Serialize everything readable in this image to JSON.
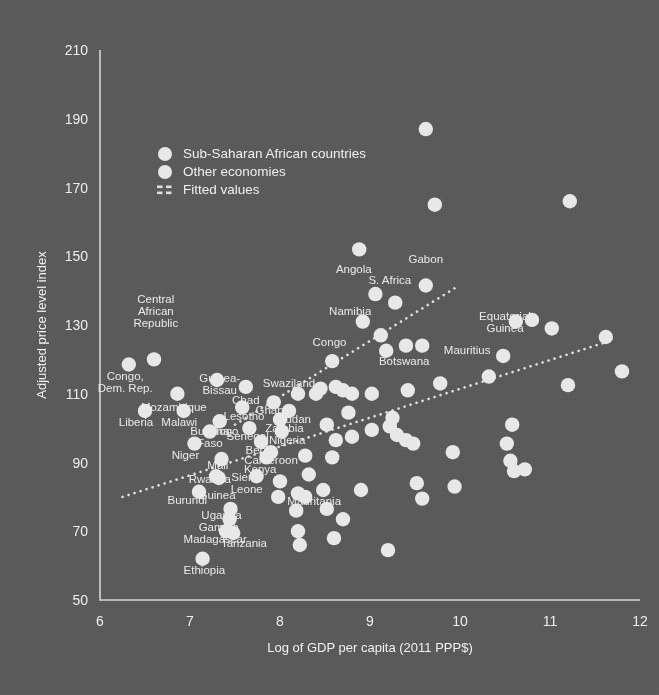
{
  "chart_data": {
    "type": "scatter",
    "title": "",
    "xlabel": "Log of GDP per capita (2011 PPP$)",
    "ylabel": "Adjusted price level index",
    "xlim": [
      6,
      12
    ],
    "ylim": [
      50,
      210
    ],
    "xticks": [
      "6",
      "7",
      "8",
      "9",
      "10",
      "11",
      "12"
    ],
    "yticks": [
      "50",
      "70",
      "90",
      "110",
      "130",
      "150",
      "170",
      "190",
      "210"
    ],
    "grid": false,
    "legend_position": "upper-left-inside",
    "legend": [
      {
        "label": "Sub-Saharan African countries",
        "marker": "circle",
        "color": "#e8e8e8"
      },
      {
        "label": "Other economies",
        "marker": "circle",
        "color": "#e8e8e8"
      },
      {
        "label": "Fitted values",
        "marker": "dotted-line",
        "color": "#e0e0e0"
      }
    ],
    "series": [
      {
        "name": "Sub-Saharan African countries",
        "color": "#e8e8e8",
        "points": [
          {
            "label": "Congo, Dem. Rep.",
            "x": 6.32,
            "y": 118.5,
            "lx": 6.28,
            "ly": 110.5,
            "anchor": "middle"
          },
          {
            "label": "Central African Republic",
            "x": 6.6,
            "y": 120.0,
            "lx": 6.62,
            "ly": 129.5,
            "anchor": "middle"
          },
          {
            "label": "Liberia",
            "x": 6.5,
            "y": 105.0,
            "lx": 6.4,
            "ly": 100.5,
            "anchor": "middle"
          },
          {
            "label": "Mozambique",
            "x": 6.86,
            "y": 110.0,
            "lx": 6.82,
            "ly": 105.0,
            "anchor": "middle"
          },
          {
            "label": "Malawi",
            "x": 6.93,
            "y": 105.0,
            "lx": 6.88,
            "ly": 100.5,
            "anchor": "middle"
          },
          {
            "label": "Niger",
            "x": 7.05,
            "y": 95.5,
            "lx": 6.95,
            "ly": 91.0,
            "anchor": "middle"
          },
          {
            "label": "Burkina Faso",
            "x": 7.22,
            "y": 99.0,
            "lx": 7.22,
            "ly": 94.5,
            "anchor": "middle"
          },
          {
            "label": "Burundi",
            "x": 7.1,
            "y": 81.5,
            "lx": 6.97,
            "ly": 78.0,
            "anchor": "middle"
          },
          {
            "label": "Rwanda",
            "x": 7.29,
            "y": 86.0,
            "lx": 7.22,
            "ly": 84.0,
            "anchor": "middle"
          },
          {
            "label": "Guinea",
            "x": 7.32,
            "y": 85.5,
            "lx": 7.3,
            "ly": 79.5,
            "anchor": "middle"
          },
          {
            "label": "Mali",
            "x": 7.35,
            "y": 91.0,
            "lx": 7.31,
            "ly": 88.0,
            "anchor": "middle"
          },
          {
            "label": "Guinea-Bissau",
            "x": 7.3,
            "y": 114.0,
            "lx": 7.33,
            "ly": 110.0,
            "anchor": "middle"
          },
          {
            "label": "Togo",
            "x": 7.33,
            "y": 102.0,
            "lx": 7.4,
            "ly": 98.0,
            "anchor": "middle"
          },
          {
            "label": "Lesotho",
            "x": 7.58,
            "y": 106.0,
            "lx": 7.6,
            "ly": 102.5,
            "anchor": "middle"
          },
          {
            "label": "Chad",
            "x": 7.62,
            "y": 112.0,
            "lx": 7.62,
            "ly": 107.0,
            "anchor": "middle"
          },
          {
            "label": "Senegal",
            "x": 7.66,
            "y": 100.0,
            "lx": 7.64,
            "ly": 96.5,
            "anchor": "middle"
          },
          {
            "label": "Uganda",
            "x": 7.45,
            "y": 76.5,
            "lx": 7.35,
            "ly": 73.5,
            "anchor": "middle"
          },
          {
            "label": "Gambia",
            "x": 7.44,
            "y": 73.5,
            "lx": 7.32,
            "ly": 70.0,
            "anchor": "middle"
          },
          {
            "label": "Madagascar",
            "x": 7.4,
            "y": 70.0,
            "lx": 7.28,
            "ly": 66.5,
            "anchor": "middle"
          },
          {
            "label": "Tanzania",
            "x": 7.48,
            "y": 69.5,
            "lx": 7.6,
            "ly": 65.5,
            "anchor": "middle"
          },
          {
            "label": "Ethiopia",
            "x": 7.14,
            "y": 62.0,
            "lx": 7.16,
            "ly": 57.5,
            "anchor": "middle"
          },
          {
            "label": "Sierra Leone",
            "x": 7.74,
            "y": 86.0,
            "lx": 7.63,
            "ly": 81.0,
            "anchor": "middle"
          },
          {
            "label": "Kenya",
            "x": 7.85,
            "y": 91.5,
            "lx": 7.78,
            "ly": 87.0,
            "anchor": "middle"
          },
          {
            "label": "Benin",
            "x": 7.79,
            "y": 96.0,
            "lx": 7.78,
            "ly": 92.5,
            "anchor": "middle"
          },
          {
            "label": "Cameroon",
            "x": 7.9,
            "y": 93.0,
            "lx": 7.9,
            "ly": 89.5,
            "anchor": "middle"
          },
          {
            "label": "Zambia",
            "x": 8.0,
            "y": 102.5,
            "lx": 8.05,
            "ly": 99.0,
            "anchor": "middle"
          },
          {
            "label": "Nigeria",
            "x": 8.02,
            "y": 99.0,
            "lx": 8.08,
            "ly": 95.5,
            "anchor": "middle"
          },
          {
            "label": "Ghana",
            "x": 7.93,
            "y": 107.5,
            "lx": 7.92,
            "ly": 104.0,
            "anchor": "middle"
          },
          {
            "label": "Sudan",
            "x": 8.1,
            "y": 105.0,
            "lx": 8.16,
            "ly": 101.5,
            "anchor": "middle"
          },
          {
            "label": "Swaziland",
            "x": 8.2,
            "y": 110.0,
            "lx": 8.1,
            "ly": 112.0,
            "anchor": "middle"
          },
          {
            "label": "Mauritania",
            "x": 8.28,
            "y": 80.0,
            "lx": 8.38,
            "ly": 77.5,
            "anchor": "middle"
          },
          {
            "label": "Congo",
            "x": 8.58,
            "y": 119.5,
            "lx": 8.55,
            "ly": 124.0,
            "anchor": "middle"
          },
          {
            "label": "Angola",
            "x": 8.88,
            "y": 152.0,
            "lx": 8.82,
            "ly": 145.0,
            "anchor": "middle"
          },
          {
            "label": "Namibia",
            "x": 8.92,
            "y": 131.0,
            "lx": 8.78,
            "ly": 133.0,
            "anchor": "middle"
          },
          {
            "label": "S. Africa",
            "x": 9.28,
            "y": 136.5,
            "lx": 9.22,
            "ly": 142.0,
            "anchor": "middle"
          },
          {
            "label": "Gabon",
            "x": 9.62,
            "y": 141.5,
            "lx": 9.62,
            "ly": 148.0,
            "anchor": "middle"
          },
          {
            "label": "Botswana",
            "x": 9.4,
            "y": 124.0,
            "lx": 9.38,
            "ly": 118.5,
            "anchor": "middle"
          },
          {
            "label": "Mauritius",
            "x": 9.58,
            "y": 124.0,
            "lx": 9.82,
            "ly": 121.5,
            "anchor": "start"
          },
          {
            "label": "Equatorial Guinea",
            "x": 10.62,
            "y": 131.0,
            "lx": 10.5,
            "ly": 128.0,
            "anchor": "middle"
          }
        ]
      },
      {
        "name": "Other economies",
        "color": "#e8e8e8",
        "points": [
          {
            "x": 9.62,
            "y": 187.0
          },
          {
            "x": 9.72,
            "y": 165.0
          },
          {
            "x": 11.22,
            "y": 166.0
          },
          {
            "x": 9.06,
            "y": 139.0
          },
          {
            "x": 9.18,
            "y": 122.5
          },
          {
            "x": 9.42,
            "y": 111.0
          },
          {
            "x": 9.12,
            "y": 127.0
          },
          {
            "x": 8.62,
            "y": 112.0
          },
          {
            "x": 8.7,
            "y": 111.0
          },
          {
            "x": 8.8,
            "y": 110.0
          },
          {
            "x": 8.76,
            "y": 104.5
          },
          {
            "x": 8.52,
            "y": 101.0
          },
          {
            "x": 8.4,
            "y": 110.0
          },
          {
            "x": 8.45,
            "y": 111.5
          },
          {
            "x": 9.02,
            "y": 110.0
          },
          {
            "x": 9.25,
            "y": 103.0
          },
          {
            "x": 8.62,
            "y": 96.5
          },
          {
            "x": 8.8,
            "y": 97.5
          },
          {
            "x": 9.02,
            "y": 99.5
          },
          {
            "x": 9.22,
            "y": 100.5
          },
          {
            "x": 9.3,
            "y": 98.0
          },
          {
            "x": 9.4,
            "y": 96.5
          },
          {
            "x": 9.48,
            "y": 95.5
          },
          {
            "x": 8.28,
            "y": 92.0
          },
          {
            "x": 8.58,
            "y": 91.5
          },
          {
            "x": 8.32,
            "y": 86.5
          },
          {
            "x": 8.2,
            "y": 81.0
          },
          {
            "x": 8.0,
            "y": 84.5
          },
          {
            "x": 7.98,
            "y": 80.0
          },
          {
            "x": 8.18,
            "y": 76.0
          },
          {
            "x": 8.2,
            "y": 70.0
          },
          {
            "x": 8.22,
            "y": 66.0
          },
          {
            "x": 8.52,
            "y": 76.5
          },
          {
            "x": 8.48,
            "y": 82.0
          },
          {
            "x": 8.7,
            "y": 73.5
          },
          {
            "x": 8.6,
            "y": 68.0
          },
          {
            "x": 8.9,
            "y": 82.0
          },
          {
            "x": 9.2,
            "y": 64.5
          },
          {
            "x": 9.52,
            "y": 84.0
          },
          {
            "x": 9.58,
            "y": 79.5
          },
          {
            "x": 10.52,
            "y": 95.5
          },
          {
            "x": 10.56,
            "y": 90.5
          },
          {
            "x": 10.6,
            "y": 87.5
          },
          {
            "x": 10.72,
            "y": 88.0
          },
          {
            "x": 10.58,
            "y": 101.0
          },
          {
            "x": 10.32,
            "y": 115.0
          },
          {
            "x": 10.48,
            "y": 121.0
          },
          {
            "x": 10.8,
            "y": 131.5
          },
          {
            "x": 11.02,
            "y": 129.0
          },
          {
            "x": 11.2,
            "y": 112.5
          },
          {
            "x": 11.62,
            "y": 126.5
          },
          {
            "x": 11.8,
            "y": 116.5
          },
          {
            "x": 9.78,
            "y": 113.0
          },
          {
            "x": 9.92,
            "y": 93.0
          },
          {
            "x": 9.94,
            "y": 83.0
          }
        ]
      }
    ],
    "fitted_lines": [
      {
        "name": "upper-fit",
        "x0": 7.5,
        "y0": 101.0,
        "x1": 9.96,
        "y1": 141.0
      },
      {
        "name": "lower-fit",
        "x0": 6.25,
        "y0": 80.0,
        "x1": 11.62,
        "y1": 125.0
      }
    ]
  }
}
